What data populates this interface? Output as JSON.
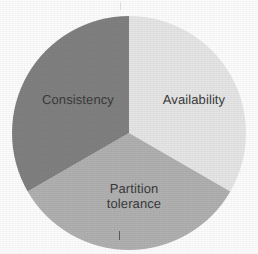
{
  "figure": {
    "width": 258,
    "height": 254,
    "background_color": "#fcfcfc",
    "text_color": "#3a3a3a"
  },
  "marks": {
    "bottom_tick_name": "bottom-tick-mark",
    "top_tick_name": "top-tick-mark"
  },
  "chart_data": {
    "type": "pie",
    "title": "",
    "subtitle": "",
    "xlabel": "",
    "ylabel": "",
    "grid": false,
    "legend_position": "none",
    "labels_inside_slices": true,
    "center": {
      "x": 129,
      "y": 133
    },
    "radius": 117,
    "start_angle_deg": 0,
    "direction": "clockwise",
    "categories": [
      "Availability",
      "Partition tolerance",
      "Consistency"
    ],
    "values": [
      33.33,
      33.33,
      33.33
    ],
    "colors": [
      "#e5e5e5",
      "#b0b0b0",
      "#808080"
    ],
    "slices": [
      {
        "label": "Availability",
        "label_line_1": "Availability",
        "label_line_2": "",
        "value": 33.33,
        "percent": "33.3%",
        "start_angle_deg": 0,
        "end_angle_deg": 120,
        "color": "#e5e5e5"
      },
      {
        "label": "Partition tolerance",
        "label_line_1": "Partition",
        "label_line_2": "tolerance",
        "value": 33.33,
        "percent": "33.3%",
        "start_angle_deg": 120,
        "end_angle_deg": 240,
        "color": "#b0b0b0"
      },
      {
        "label": "Consistency",
        "label_line_1": "Consistency",
        "label_line_2": "",
        "value": 33.33,
        "percent": "33.3%",
        "start_angle_deg": 240,
        "end_angle_deg": 360,
        "color": "#808080"
      }
    ]
  }
}
